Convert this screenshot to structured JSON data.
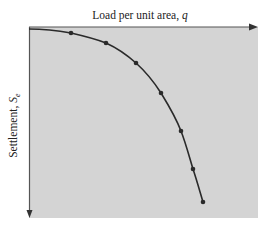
{
  "chart_data": {
    "type": "line",
    "title": "",
    "xlabel": "Load per unit area, q",
    "ylabel": "Settlement, S_e",
    "xlabel_parts": {
      "text": "Load per unit area, ",
      "symbol": "q"
    },
    "ylabel_parts": {
      "text": "Settlement, ",
      "symbol": "S",
      "subscript": "e"
    },
    "axes": {
      "x_axis_position": "top",
      "x_direction": "right (arrow)",
      "y_direction": "down (arrow)",
      "ticks": "none",
      "grid": false,
      "background": "#d4d4d4"
    },
    "series": [
      {
        "name": "load-settlement curve",
        "marker": "dot",
        "points_px": [
          [
            71,
            33
          ],
          [
            106,
            43
          ],
          [
            136,
            63
          ],
          [
            161,
            93
          ],
          [
            181,
            131
          ],
          [
            193,
            169
          ],
          [
            203,
            202
          ]
        ],
        "points_normalized": [
          {
            "q": 0.18,
            "S": 0.04
          },
          {
            "q": 0.34,
            "S": 0.09
          },
          {
            "q": 0.47,
            "S": 0.19
          },
          {
            "q": 0.58,
            "S": 0.35
          },
          {
            "q": 0.67,
            "S": 0.54
          },
          {
            "q": 0.72,
            "S": 0.74
          },
          {
            "q": 0.77,
            "S": 0.91
          }
        ]
      }
    ],
    "legend": null
  },
  "colors": {
    "plot_bg": "#d4d4d4",
    "line": "#2a2a2a",
    "axis": "#555555",
    "text": "#222222"
  }
}
